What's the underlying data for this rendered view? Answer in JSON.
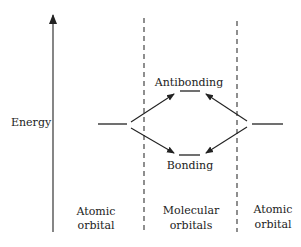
{
  "diagram": {
    "type": "molecular-orbital-energy-diagram",
    "axis": {
      "label": "Energy",
      "direction": "up"
    },
    "levels": {
      "antibonding": {
        "label": "Antibonding"
      },
      "bonding": {
        "label": "Bonding"
      },
      "left_atomic": {
        "label": ""
      },
      "right_atomic": {
        "label": ""
      }
    },
    "columns": [
      {
        "line1": "Atomic",
        "line2": "orbital"
      },
      {
        "line1": "Molecular",
        "line2": "orbitals"
      },
      {
        "line1": "Atomic",
        "line2": "orbital"
      }
    ],
    "colors": {
      "ink": "#222222",
      "background": "#ffffff"
    }
  }
}
